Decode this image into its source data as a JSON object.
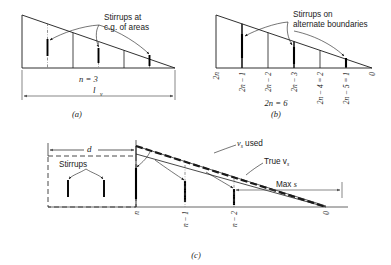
{
  "figure": {
    "type": "diagram",
    "panels": [
      {
        "id": "a",
        "caption": "(a)",
        "callout": {
          "line1": "Stirrups at",
          "line2": "c.g. of areas"
        },
        "dimension_label": "l",
        "dimension_sub": "v",
        "count_label": "n = 3",
        "stirrup_count": 3,
        "division_count": 3
      },
      {
        "id": "b",
        "caption": "(b)",
        "callout": {
          "line1": "Stirrups on",
          "line2": "alternate boundaries"
        },
        "axis_labels": [
          "2n",
          "2n − 1",
          "2n − 2",
          "2n − 3",
          "2n − 4 = 2",
          "2n − 5 = 1",
          "0"
        ],
        "count_label": "2n = 6",
        "stirrup_count": 3,
        "division_count": 6
      },
      {
        "id": "c",
        "caption": "(c)",
        "dimension_d": "d",
        "stirrups_label": "Stirrups",
        "vs_used_label": "v",
        "vs_used_sub": "s",
        "vs_used_tail": " used",
        "true_vs_label": "True v",
        "true_vs_sub": "s",
        "max_s_label": "Max ",
        "max_s_ital": "s",
        "axis_labels": [
          "n",
          "n − 1",
          "n − 2",
          "0"
        ]
      }
    ],
    "colors": {
      "ink": "#1a1a1a",
      "rule": "#555555",
      "dash": "#333333"
    }
  }
}
